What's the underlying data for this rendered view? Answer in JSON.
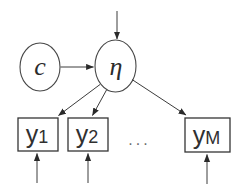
{
  "figure": {
    "kind": "path-diagram",
    "background_color": "#ffffff",
    "ink_color": "#3c3c3c",
    "nodes": {
      "covariate": {
        "label": "c",
        "shape": "ellipse"
      },
      "latent": {
        "label": "η",
        "shape": "ellipse"
      },
      "indicators": [
        {
          "base": "y",
          "sub": "1"
        },
        {
          "base": "y",
          "sub": "2"
        },
        {
          "base": "y",
          "sub": "M"
        }
      ],
      "ellipsis": "..."
    },
    "edges": [
      {
        "from": "external-top",
        "to": "latent"
      },
      {
        "from": "covariate",
        "to": "latent"
      },
      {
        "from": "latent",
        "to": "indicator-1"
      },
      {
        "from": "latent",
        "to": "indicator-2"
      },
      {
        "from": "latent",
        "to": "indicator-M"
      },
      {
        "from": "external-bottom-1",
        "to": "indicator-1"
      },
      {
        "from": "external-bottom-2",
        "to": "indicator-2"
      },
      {
        "from": "external-bottom-M",
        "to": "indicator-M"
      }
    ]
  }
}
